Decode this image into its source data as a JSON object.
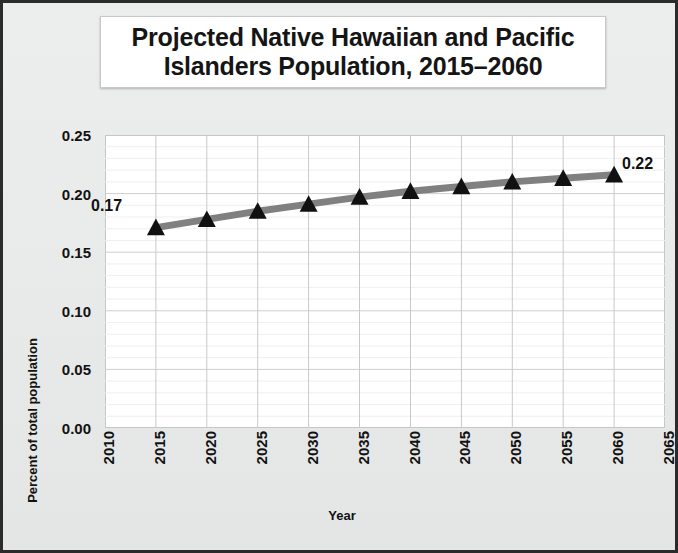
{
  "chart_data": {
    "type": "line",
    "title": "Projected Native Hawaiian and Pacific Islanders Population, 2015–2060",
    "title_line1": "Projected Native Hawaiian and Pacific",
    "title_line2": "Islanders Population, 2015–2060",
    "xlabel": "Year",
    "ylabel": "Percent of total population",
    "x": [
      2015,
      2020,
      2025,
      2030,
      2035,
      2040,
      2045,
      2050,
      2055,
      2060
    ],
    "values": [
      0.171,
      0.178,
      0.185,
      0.191,
      0.197,
      0.202,
      0.206,
      0.21,
      0.213,
      0.216
    ],
    "series": [
      {
        "name": "Percent of total population",
        "values": [
          0.171,
          0.178,
          0.185,
          0.191,
          0.197,
          0.202,
          0.206,
          0.21,
          0.213,
          0.216
        ]
      }
    ],
    "xlim": [
      2010,
      2065
    ],
    "ylim": [
      0.0,
      0.25
    ],
    "xticks": [
      "2010",
      "2015",
      "2020",
      "2025",
      "2030",
      "2035",
      "2040",
      "2045",
      "2050",
      "2055",
      "2060",
      "2065"
    ],
    "yticks": [
      "0.00",
      "0.05",
      "0.10",
      "0.15",
      "0.20",
      "0.25"
    ],
    "ytick_values": [
      0.0,
      0.05,
      0.1,
      0.15,
      0.2,
      0.25
    ],
    "grid": "major vertical + minor horizontal",
    "legend": "none",
    "annotations": [
      {
        "text": "0.17",
        "x": 2015,
        "y": 0.171,
        "position": "left"
      },
      {
        "text": "0.22",
        "x": 2060,
        "y": 0.216,
        "position": "upper-right"
      }
    ],
    "marker": "triangle",
    "marker_color": "#111111",
    "line_color": "#808080",
    "plot_background": "#ffffff",
    "figure_background": "#e9eaea"
  }
}
